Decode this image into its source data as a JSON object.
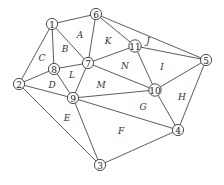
{
  "diagram": {
    "type": "planar-graph",
    "nodes": [
      {
        "id": "1",
        "x": 52,
        "y": 24
      },
      {
        "id": "2",
        "x": 19,
        "y": 84
      },
      {
        "id": "3",
        "x": 100,
        "y": 165
      },
      {
        "id": "4",
        "x": 178,
        "y": 130
      },
      {
        "id": "5",
        "x": 206,
        "y": 60
      },
      {
        "id": "6",
        "x": 96,
        "y": 14
      },
      {
        "id": "7",
        "x": 88,
        "y": 63
      },
      {
        "id": "8",
        "x": 54,
        "y": 69
      },
      {
        "id": "9",
        "x": 73,
        "y": 98
      },
      {
        "id": "10",
        "x": 155,
        "y": 90
      },
      {
        "id": "11",
        "x": 135,
        "y": 46
      }
    ],
    "edges": [
      [
        "1",
        "6"
      ],
      [
        "1",
        "7"
      ],
      [
        "1",
        "8"
      ],
      [
        "1",
        "2"
      ],
      [
        "6",
        "7"
      ],
      [
        "6",
        "11"
      ],
      [
        "6",
        "5"
      ],
      [
        "7",
        "8"
      ],
      [
        "7",
        "9"
      ],
      [
        "7",
        "11"
      ],
      [
        "7",
        "10"
      ],
      [
        "8",
        "2"
      ],
      [
        "8",
        "9"
      ],
      [
        "2",
        "9"
      ],
      [
        "2",
        "3"
      ],
      [
        "9",
        "10"
      ],
      [
        "9",
        "4"
      ],
      [
        "9",
        "3"
      ],
      [
        "11",
        "5"
      ],
      [
        "11",
        "10"
      ],
      [
        "10",
        "5"
      ],
      [
        "10",
        "4"
      ],
      [
        "5",
        "4"
      ],
      [
        "3",
        "4"
      ]
    ],
    "regions": [
      {
        "label": "A",
        "x": 80,
        "y": 35
      },
      {
        "label": "B",
        "x": 65,
        "y": 49
      },
      {
        "label": "C",
        "x": 42,
        "y": 58
      },
      {
        "label": "D",
        "x": 52,
        "y": 85
      },
      {
        "label": "E",
        "x": 67,
        "y": 118
      },
      {
        "label": "F",
        "x": 121,
        "y": 131
      },
      {
        "label": "G",
        "x": 143,
        "y": 107
      },
      {
        "label": "H",
        "x": 182,
        "y": 97
      },
      {
        "label": "I",
        "x": 162,
        "y": 67
      },
      {
        "label": "J",
        "x": 148,
        "y": 41
      },
      {
        "label": "K",
        "x": 108,
        "y": 41
      },
      {
        "label": "L",
        "x": 72,
        "y": 75
      },
      {
        "label": "M",
        "x": 101,
        "y": 85
      },
      {
        "label": "N",
        "x": 125,
        "y": 66
      }
    ]
  }
}
